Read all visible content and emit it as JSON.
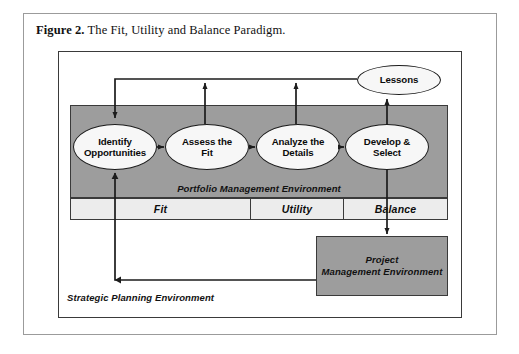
{
  "caption": {
    "label": "Figure 2.",
    "text": " The Fit, Utility and Balance Paradigm."
  },
  "diagram": {
    "title": "The Fit, Utility and Balance Paradigm",
    "type": "process-flow-diagram",
    "environments": {
      "strategic": "Strategic Planning Environment",
      "portfolio": "Portfolio Management Environment",
      "project": "Project\nManagement Environment",
      "project_line1": "Project",
      "project_line2": "Management Environment"
    },
    "process_steps": [
      {
        "line1": "Identify",
        "line2": "Opportunities"
      },
      {
        "line1": "Assess the",
        "line2": "Fit"
      },
      {
        "line1": "Analyze the",
        "line2": "Details"
      },
      {
        "line1": "Develop &",
        "line2": "Select"
      }
    ],
    "feedback_node": {
      "label": "Lessons"
    },
    "phase_bands": [
      {
        "label": "Fit"
      },
      {
        "label": "Utility"
      },
      {
        "label": "Balance"
      }
    ],
    "colors": {
      "environment_fill": "#9d9d9d",
      "band_fill": "#ececec",
      "ellipse_fill": "#f7f7f7",
      "stroke": "#1c1c1c",
      "page_background": "#ffffff"
    }
  }
}
